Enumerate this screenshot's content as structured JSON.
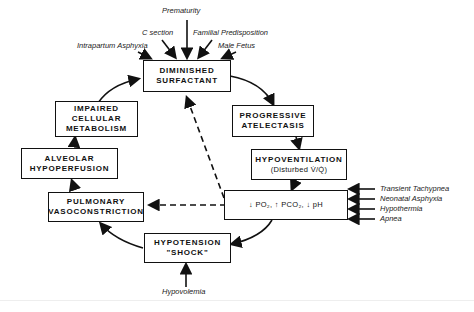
{
  "figure": {
    "type": "cyclic flow diagram",
    "nodes": {
      "diminished_surfactant": [
        "DIMINISHED",
        "SURFACTANT"
      ],
      "progressive_atelectasis": [
        "PROGRESSIVE",
        "ATELECTASIS"
      ],
      "hypoventilation": {
        "line1": "HYPOVENTILATION",
        "line2": "(Disturbed V̇/Q̇)"
      },
      "blood_gases": "↓ PO₂, ↑ PCO₂, ↓ pH",
      "hypotension": [
        "HYPOTENSION",
        "\"SHOCK\""
      ],
      "pulmonary_vasoconstriction": [
        "PULMONARY",
        "VASOCONSTRICTION"
      ],
      "alveolar_hypoperfusion": [
        "ALVEOLAR",
        "HYPOPERFUSION"
      ],
      "impaired_cellular_metabolism": [
        "IMPAIRED",
        "CELLULAR",
        "METABOLISM"
      ]
    },
    "surfactant_causes": [
      "Prematurity",
      "C section",
      "Familial Predisposition",
      "Intrapartum Asphyxia",
      "Male Fetus"
    ],
    "blood_gas_causes": [
      "Transient Tachypnea",
      "Neonatal Asphyxia",
      "Hypothermia",
      "Apnea"
    ],
    "hypotension_cause": "Hypovolemia"
  }
}
